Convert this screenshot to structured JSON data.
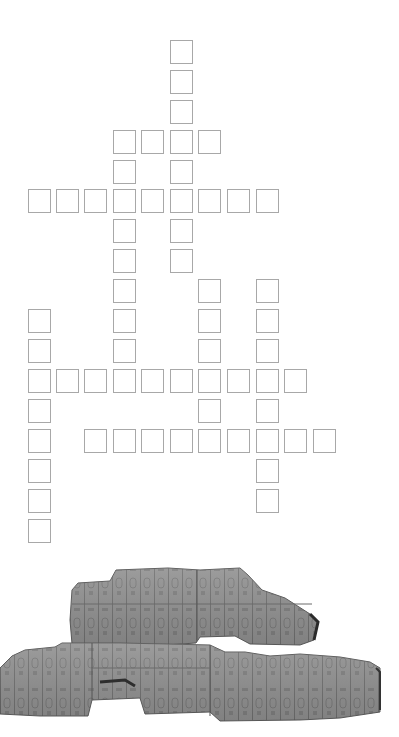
{
  "puzzle": {
    "type": "crossword",
    "cell_size": 24,
    "column_x": [
      28,
      56,
      84,
      113,
      141,
      170,
      198,
      227,
      256,
      284,
      313
    ],
    "row_y": [
      40,
      70,
      100,
      130,
      160,
      189,
      219,
      249,
      279,
      309,
      339,
      369,
      399,
      429,
      459,
      489,
      519
    ],
    "cells": [
      [
        0,
        5
      ],
      [
        1,
        5
      ],
      [
        2,
        5
      ],
      [
        3,
        3
      ],
      [
        3,
        4
      ],
      [
        3,
        5
      ],
      [
        3,
        6
      ],
      [
        4,
        3
      ],
      [
        4,
        5
      ],
      [
        5,
        0
      ],
      [
        5,
        1
      ],
      [
        5,
        2
      ],
      [
        5,
        3
      ],
      [
        5,
        4
      ],
      [
        5,
        5
      ],
      [
        5,
        6
      ],
      [
        5,
        7
      ],
      [
        5,
        8
      ],
      [
        6,
        3
      ],
      [
        6,
        5
      ],
      [
        7,
        3
      ],
      [
        7,
        5
      ],
      [
        8,
        3
      ],
      [
        8,
        6
      ],
      [
        8,
        8
      ],
      [
        9,
        0
      ],
      [
        9,
        3
      ],
      [
        9,
        6
      ],
      [
        9,
        8
      ],
      [
        10,
        0
      ],
      [
        10,
        3
      ],
      [
        10,
        6
      ],
      [
        10,
        8
      ],
      [
        11,
        0
      ],
      [
        11,
        1
      ],
      [
        11,
        2
      ],
      [
        11,
        3
      ],
      [
        11,
        4
      ],
      [
        11,
        5
      ],
      [
        11,
        6
      ],
      [
        11,
        7
      ],
      [
        11,
        8
      ],
      [
        11,
        9
      ],
      [
        12,
        0
      ],
      [
        12,
        6
      ],
      [
        12,
        8
      ],
      [
        13,
        0
      ],
      [
        13,
        2
      ],
      [
        13,
        3
      ],
      [
        13,
        4
      ],
      [
        13,
        5
      ],
      [
        13,
        6
      ],
      [
        13,
        7
      ],
      [
        13,
        8
      ],
      [
        13,
        9
      ],
      [
        13,
        10
      ],
      [
        14,
        0
      ],
      [
        14,
        8
      ],
      [
        15,
        0
      ],
      [
        15,
        8
      ],
      [
        16,
        0
      ]
    ],
    "cell_values": "",
    "colors": {
      "cell_border": "#a8a8a8",
      "background": "#ffffff"
    }
  },
  "image": {
    "subject": "stone-tablet-hieroglyph-relief",
    "colors": {
      "stone": "#8c8c8c",
      "stone_light": "#a3a3a3",
      "stone_dark": "#5e5e5e",
      "line": "#6a6a6a"
    }
  }
}
